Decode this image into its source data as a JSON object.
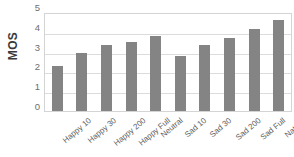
{
  "chart_data": {
    "type": "bar",
    "title": "",
    "xlabel": "",
    "ylabel": "MOS",
    "ylim": [
      0,
      5
    ],
    "yticks": [
      0,
      1,
      2,
      3,
      4,
      5
    ],
    "ytick_labels": [
      "0",
      "1",
      "2",
      "3",
      "4",
      "5"
    ],
    "grid": true,
    "legend": false,
    "bar_color": "#848484",
    "categories": [
      "Happy 10",
      "Happy 30",
      "Happy 200",
      "Happy Full",
      "Neutral",
      "Sad 10",
      "Sad 30",
      "Sad 200",
      "Sad Full",
      "Natural"
    ],
    "values": [
      2.25,
      2.95,
      3.35,
      3.5,
      3.8,
      2.8,
      3.35,
      3.7,
      4.15,
      4.6
    ]
  }
}
